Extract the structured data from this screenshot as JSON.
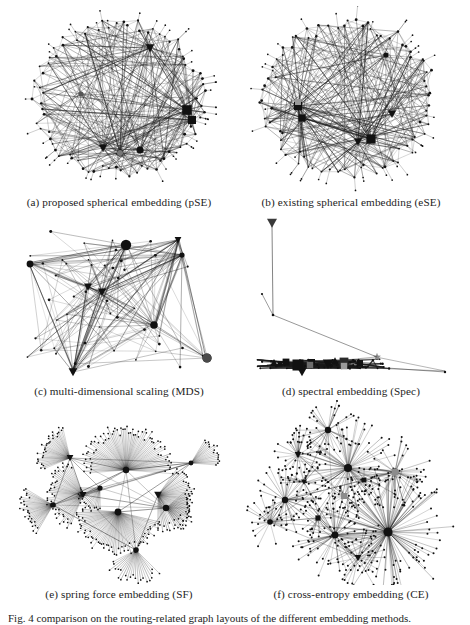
{
  "figure": {
    "id": "Fig. 4",
    "caption_text": "Fig. 4   comparison on the routing-related graph layouts of the different embedding methods.",
    "background_color": "#ffffff",
    "ink_color": "#1a1a1a",
    "layout": {
      "rows": 3,
      "columns": 2
    }
  },
  "panels": [
    {
      "key": "a",
      "caption": "(a) proposed spherical embedding (pSE)",
      "method_name": "proposed spherical embedding",
      "method_abbr": "pSE",
      "layout_style": "ring",
      "description": "Nodes distributed on a near-circular ring with long chords crossing the empty interior; several dark hub clusters on the ring."
    },
    {
      "key": "b",
      "caption": "(b) existing spherical embedding (eSE)",
      "method_name": "existing spherical embedding",
      "method_abbr": "eSE",
      "layout_style": "ring",
      "description": "Similar ring/ellipse arrangement, denser on the left side, with chords crossing a hollow center."
    },
    {
      "key": "c",
      "caption": "(c) multi-dimensional scaling (MDS)",
      "method_name": "multi-dimensional scaling",
      "method_abbr": "MDS",
      "layout_style": "blob",
      "description": "Irregular filled blob of straight edges between scattered hubs, one large round node at lower right and a triangle node at lower left."
    },
    {
      "key": "d",
      "caption": "(d) spectral embedding (Spec)",
      "method_name": "spectral embedding",
      "method_abbr": "Spec",
      "layout_style": "degenerate",
      "description": "Degenerate layout: nearly all nodes collapse onto a thin horizontal band at the bottom, with one far outlier at top left and a star marker at mid right."
    },
    {
      "key": "e",
      "caption": "(e) spring force embedding (SF)",
      "method_name": "spring force embedding",
      "method_abbr": "SF",
      "layout_style": "fan-clusters",
      "description": "Dense overlapping fan and starburst bundles radiating from tightly packed hubs near the center."
    },
    {
      "key": "f",
      "caption": "(f) cross-entropy embedding (CE)",
      "method_name": "cross-entropy embedding",
      "method_abbr": "CE",
      "layout_style": "star-clusters",
      "description": "Several well separated star clusters with long radial spokes ending in small round leaf nodes."
    }
  ]
}
